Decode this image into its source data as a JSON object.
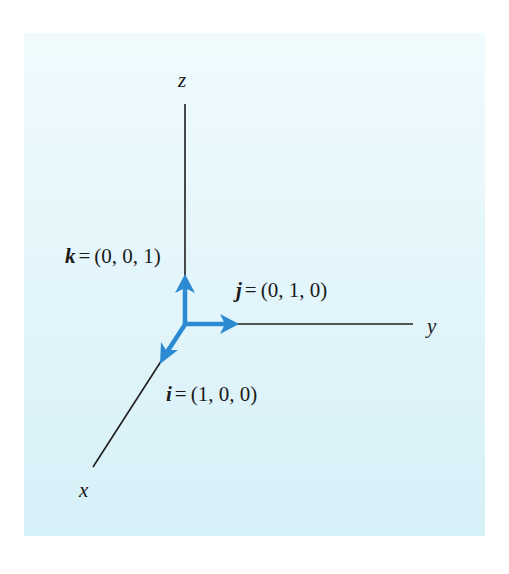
{
  "diagram": {
    "axes": {
      "x": {
        "label": "x"
      },
      "y": {
        "label": "y"
      },
      "z": {
        "label": "z"
      }
    },
    "vectors": [
      {
        "symbol": "i",
        "equals": "=",
        "value": "(1, 0, 0)",
        "axis": "x"
      },
      {
        "symbol": "j",
        "equals": "=",
        "value": "(0, 1, 0)",
        "axis": "y"
      },
      {
        "symbol": "k",
        "equals": "=",
        "value": "(0, 0, 1)",
        "axis": "z"
      }
    ],
    "colors": {
      "vector": "#2b8ad2",
      "axis": "#1e1e1e",
      "panel_top": "#f0fbfd",
      "panel_bottom": "#d6f0f7"
    }
  }
}
